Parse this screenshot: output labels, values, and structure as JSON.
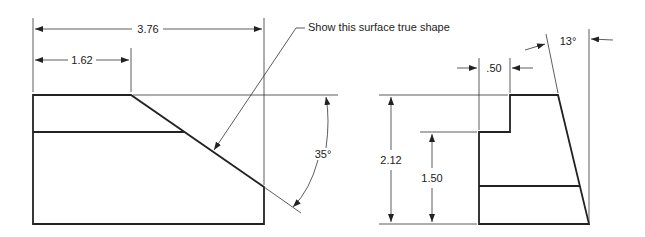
{
  "drawing": {
    "type": "orthographic technical drawing",
    "views": [
      "front",
      "side"
    ],
    "colors": {
      "line": "#222222",
      "background": "#ffffff"
    }
  },
  "front_view": {
    "dim_overall_width": "3.76",
    "dim_top_width": "1.62",
    "angle": "35°",
    "leader_note": "Show this surface true shape"
  },
  "side_view": {
    "dim_step_width": ".50",
    "dim_overall_height": "2.12",
    "dim_step_height": "1.50",
    "taper_angle": "13°"
  }
}
